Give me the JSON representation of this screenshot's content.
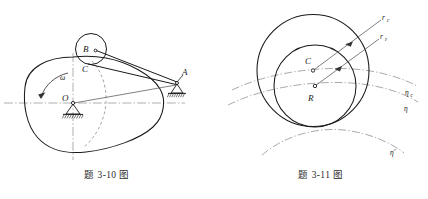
{
  "sheet": {
    "background": "#ffffff",
    "stroke_color": "#1a1a1a",
    "thin_stroke_color": "#707070",
    "dash_color": "#8a8a8a"
  },
  "figures": [
    {
      "id": "fig-3-10",
      "caption": "题 3-10 图",
      "description": "Cam mechanism with oval cam rotating about pin O, roller B, point C, rod to pin support A",
      "labels": {
        "omega": "ω",
        "center_o": "O",
        "roller_b": "B",
        "point_c": "C",
        "support_a": "A"
      }
    },
    {
      "id": "fig-3-11",
      "caption": "题 3-11 图",
      "description": "Two tangent circles with radii r_c and r_epsilon, centers C and R, and three dash-dot arcs eta_c, eta, eta-prime",
      "labels": {
        "radius_c": "r",
        "radius_c_sub": "c",
        "radius_e": "r",
        "radius_e_sub": "ε",
        "center_c": "C",
        "center_r": "R",
        "curve_eta_c": "η",
        "curve_eta_c_sub": "c",
        "curve_eta": "η",
        "curve_eta_prime": "η′"
      }
    }
  ]
}
